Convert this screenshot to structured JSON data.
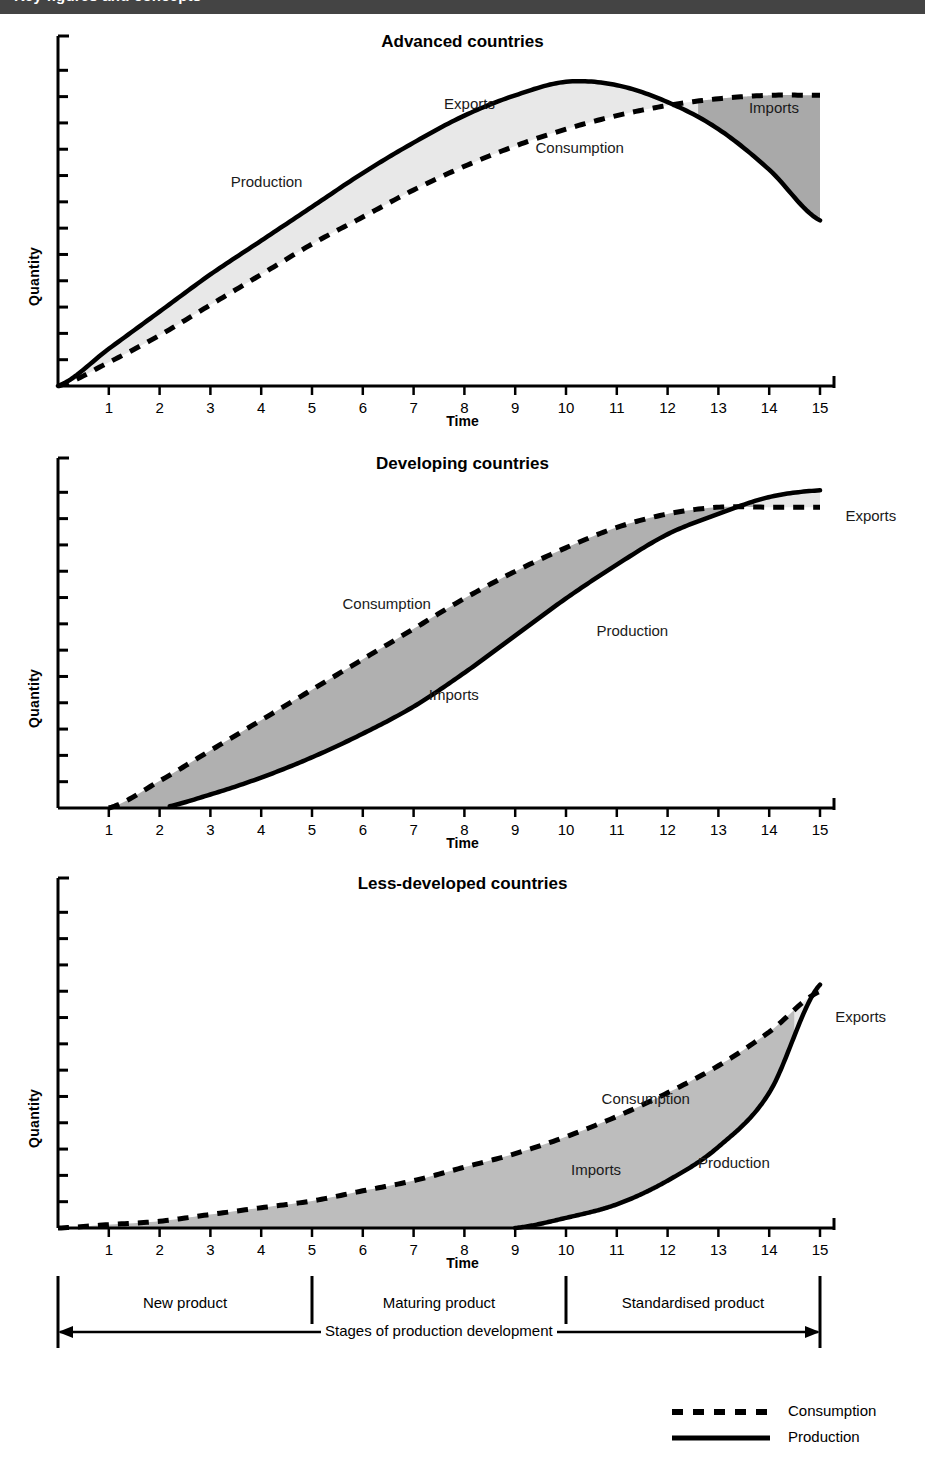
{
  "header": {
    "banner_text": "Key figures and concepts",
    "banner_color": "#444444"
  },
  "axis": {
    "ylabel": "Quantity",
    "xlabel": "Time",
    "xticks": [
      "1",
      "2",
      "3",
      "4",
      "5",
      "6",
      "7",
      "8",
      "9",
      "10",
      "11",
      "12",
      "13",
      "14",
      "15"
    ]
  },
  "legend": {
    "items": [
      {
        "label": "Consumption",
        "style": "dashed"
      },
      {
        "label": "Production",
        "style": "solid"
      }
    ]
  },
  "stages": {
    "caption": "Stages of production development",
    "items": [
      {
        "label": "New product",
        "start": 0,
        "end": 5
      },
      {
        "label": "Maturing product",
        "start": 5,
        "end": 10
      },
      {
        "label": "Standardised product",
        "start": 10,
        "end": 15
      }
    ],
    "dividers": [
      5,
      10
    ]
  },
  "charts": [
    {
      "title": "Advanced countries",
      "labels": [
        {
          "text": "Production",
          "x": 3.4,
          "y": 0.6
        },
        {
          "text": "Exports",
          "x": 7.6,
          "y": 0.83
        },
        {
          "text": "Consumption",
          "x": 9.4,
          "y": 0.7
        },
        {
          "text": "Imports",
          "x": 13.6,
          "y": 0.82
        }
      ],
      "regions": [
        {
          "name": "Exports",
          "fill": "#e8e8e8",
          "from": 0.0,
          "to": 12.6
        },
        {
          "name": "Imports",
          "fill": "#a9a9a9",
          "from": 12.6,
          "to": 15.0
        }
      ]
    },
    {
      "title": "Developing countries",
      "labels": [
        {
          "text": "Consumption",
          "x": 5.6,
          "y": 0.6
        },
        {
          "text": "Imports",
          "x": 7.3,
          "y": 0.33
        },
        {
          "text": "Production",
          "x": 10.6,
          "y": 0.52
        },
        {
          "text": "Exports",
          "x": 15.5,
          "y": 0.86
        }
      ],
      "regions": [
        {
          "name": "Imports",
          "fill": "#b0b0b0",
          "from": 1.0,
          "to": 13.7
        },
        {
          "name": "Exports",
          "fill": "#e8e8e8",
          "from": 13.7,
          "to": 15.0
        }
      ]
    },
    {
      "title": "Less-developed countries",
      "labels": [
        {
          "text": "Consumption",
          "x": 10.7,
          "y": 0.38
        },
        {
          "text": "Imports",
          "x": 10.1,
          "y": 0.17
        },
        {
          "text": "Production",
          "x": 12.6,
          "y": 0.19
        },
        {
          "text": "Exports",
          "x": 15.3,
          "y": 0.62
        }
      ],
      "regions": [
        {
          "name": "Imports",
          "fill": "#bdbdbd",
          "from": 0.6,
          "to": 14.5
        },
        {
          "name": "Exports",
          "fill": "#e8e8e8",
          "from": 14.5,
          "to": 15.0
        }
      ]
    }
  ],
  "chart_data": {
    "type": "line",
    "xlabel": "Time",
    "ylabel": "Quantity",
    "xlim": [
      0,
      15
    ],
    "ylim": [
      0,
      1
    ],
    "grid": false,
    "legend_position": "bottom-right",
    "panels": [
      {
        "name": "Advanced countries",
        "x": [
          0,
          1,
          2,
          3,
          4,
          5,
          6,
          7,
          8,
          9,
          10,
          11,
          12,
          13,
          14,
          15
        ],
        "series": [
          {
            "name": "Production",
            "style": "solid",
            "values": [
              0.0,
              0.11,
              0.22,
              0.33,
              0.43,
              0.53,
              0.63,
              0.72,
              0.8,
              0.86,
              0.9,
              0.89,
              0.84,
              0.76,
              0.64,
              0.49
            ]
          },
          {
            "name": "Consumption",
            "style": "dashed",
            "values": [
              0.0,
              0.07,
              0.15,
              0.24,
              0.33,
              0.42,
              0.5,
              0.58,
              0.65,
              0.71,
              0.76,
              0.8,
              0.83,
              0.85,
              0.86,
              0.86
            ]
          }
        ],
        "shaded": [
          {
            "name": "Exports",
            "between": [
              "Production",
              "Consumption"
            ],
            "x_from": 0.0,
            "x_to": 12.6,
            "fill": "#e8e8e8"
          },
          {
            "name": "Imports",
            "between": [
              "Consumption",
              "Production"
            ],
            "x_from": 12.6,
            "x_to": 15.0,
            "fill": "#a9a9a9"
          }
        ],
        "crossover_x": 12.6,
        "production_peak_x": 10.2
      },
      {
        "name": "Developing countries",
        "x": [
          0,
          1,
          2,
          3,
          4,
          5,
          6,
          7,
          8,
          9,
          10,
          11,
          12,
          13,
          14,
          15
        ],
        "series": [
          {
            "name": "Consumption",
            "style": "dashed",
            "values": [
              null,
              0.0,
              0.08,
              0.17,
              0.26,
              0.35,
              0.44,
              0.53,
              0.62,
              0.7,
              0.77,
              0.83,
              0.87,
              0.89,
              0.89,
              0.89
            ]
          },
          {
            "name": "Production",
            "style": "solid",
            "values": [
              null,
              null,
              0.0,
              0.04,
              0.09,
              0.15,
              0.22,
              0.3,
              0.4,
              0.51,
              0.62,
              0.72,
              0.81,
              0.87,
              0.92,
              0.94
            ]
          }
        ],
        "shaded": [
          {
            "name": "Imports",
            "between": [
              "Consumption",
              "Production"
            ],
            "x_from": 1.0,
            "x_to": 13.7,
            "fill": "#b0b0b0"
          },
          {
            "name": "Exports",
            "between": [
              "Production",
              "Consumption"
            ],
            "x_from": 13.7,
            "x_to": 15.0,
            "fill": "#e8e8e8"
          }
        ],
        "crossover_x": 13.7,
        "consumption_start_x": 1.0,
        "production_start_x": 2.2
      },
      {
        "name": "Less-developed countries",
        "x": [
          0,
          1,
          2,
          3,
          4,
          5,
          6,
          7,
          8,
          9,
          10,
          11,
          12,
          13,
          14,
          15
        ],
        "series": [
          {
            "name": "Consumption",
            "style": "dashed",
            "values": [
              0.0,
              0.01,
              0.02,
              0.04,
              0.06,
              0.08,
              0.11,
              0.14,
              0.18,
              0.22,
              0.27,
              0.33,
              0.4,
              0.48,
              0.58,
              0.7
            ]
          },
          {
            "name": "Production",
            "style": "solid",
            "values": [
              null,
              null,
              null,
              null,
              null,
              null,
              null,
              null,
              null,
              0.0,
              0.03,
              0.07,
              0.14,
              0.24,
              0.4,
              0.72
            ]
          }
        ],
        "shaded": [
          {
            "name": "Imports",
            "between": [
              "Consumption",
              "Production"
            ],
            "x_from": 0.6,
            "x_to": 14.5,
            "fill": "#bdbdbd"
          },
          {
            "name": "Exports",
            "between": [
              "Production",
              "Consumption"
            ],
            "x_from": 14.5,
            "x_to": 15.0,
            "fill": "#e8e8e8"
          }
        ],
        "crossover_x": 14.5,
        "production_start_x": 9.0
      }
    ],
    "stage_boundaries": [
      {
        "label": "New product",
        "x_from": 0,
        "x_to": 5
      },
      {
        "label": "Maturing product",
        "x_from": 5,
        "x_to": 10
      },
      {
        "label": "Standardised product",
        "x_from": 10,
        "x_to": 15
      }
    ]
  }
}
